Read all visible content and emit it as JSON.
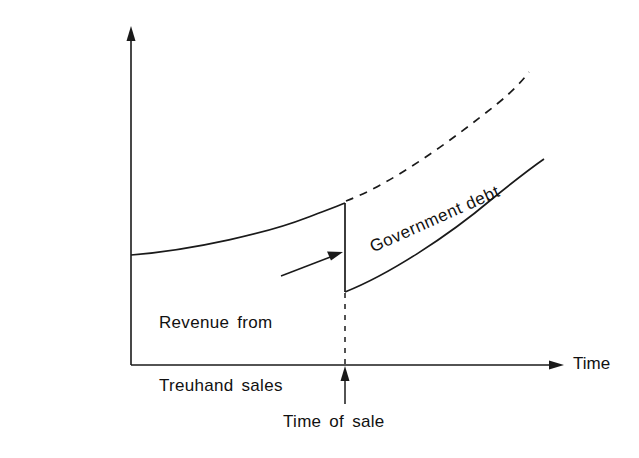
{
  "chart_data": {
    "type": "line",
    "title": "",
    "xlabel": "Time",
    "ylabel": "Net liabilities",
    "grid": false,
    "legend_position": "inline-on-curve",
    "axis_style": "arrow-tipped open axes, no tick marks, no numeric scale",
    "xlim": [
      0,
      100
    ],
    "ylim": [
      0,
      100
    ],
    "annotations": [
      {
        "name": "revenue-from-treuhand-sales",
        "text": "Revenue from\nTreuhand sales",
        "line1": "Revenue from",
        "line2": "Treuhand sales",
        "points_to": "vertical drop at time of sale"
      },
      {
        "name": "time-of-sale",
        "text": "Time of sale",
        "points_to": "x-axis at time of sale"
      }
    ],
    "series": [
      {
        "name": "Net liabilities before sale",
        "style": "solid",
        "label_shown": false,
        "points": [
          [
            0,
            47
          ],
          [
            10,
            49
          ],
          [
            20,
            52
          ],
          [
            30,
            55
          ],
          [
            40,
            60
          ],
          [
            48,
            65
          ]
        ]
      },
      {
        "name": "Counterfactual path without sale",
        "style": "dashed",
        "label_shown": false,
        "points": [
          [
            48,
            65
          ],
          [
            58,
            71
          ],
          [
            68,
            77
          ],
          [
            78,
            83
          ],
          [
            88,
            90
          ],
          [
            96,
            97
          ]
        ]
      },
      {
        "name": "Government debt",
        "style": "solid",
        "label_shown": true,
        "label": "Government debt",
        "points": [
          [
            48,
            39
          ],
          [
            58,
            44
          ],
          [
            68,
            50
          ],
          [
            78,
            57
          ],
          [
            88,
            65
          ],
          [
            98,
            74
          ]
        ]
      }
    ],
    "discontinuity": {
      "name": "Revenue from Treuhand sales",
      "x": 48,
      "y_top": 65,
      "y_bottom": 39,
      "magnitude": 26,
      "direction": "downward jump"
    },
    "marker_lines": [
      {
        "name": "time-of-sale-guide",
        "orientation": "vertical",
        "style": "dashed",
        "x": 48
      }
    ]
  }
}
